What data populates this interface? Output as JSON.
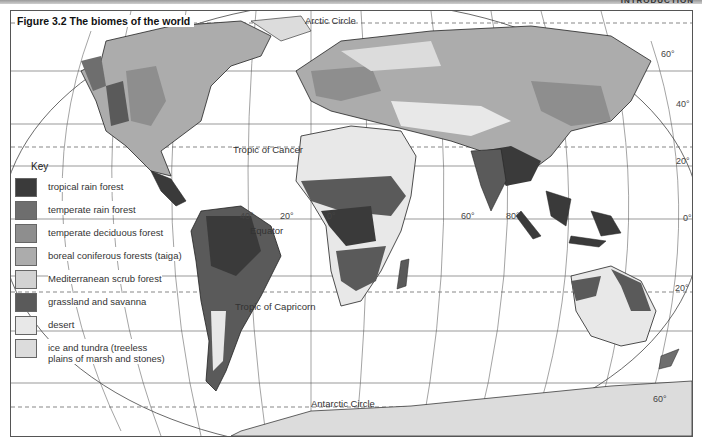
{
  "header": {
    "section": "INTRODUCTION"
  },
  "figure": {
    "title": "Figure 3.2  The biomes of the world"
  },
  "lines": {
    "arctic_circle": "Arctic Circle",
    "tropic_cancer": "Tropic of Cancer",
    "equator": "Equator",
    "tropic_capricorn": "Tropic of Capricorn",
    "antarctic_circle": "Antarctic Circle"
  },
  "latitudes": {
    "n60": "60°",
    "n40": "40°",
    "n20": "20°",
    "eq": "0°",
    "s20": "20°",
    "s60": "60°"
  },
  "longitudes": {
    "w40": "40°",
    "w20": "20°",
    "zero": "0°",
    "e60": "60°",
    "e80": "80°"
  },
  "key": {
    "title": "Key",
    "items": [
      {
        "label": "tropical rain forest",
        "color": "#3a3a3a"
      },
      {
        "label": "temperate rain forest",
        "color": "#6e6e6e"
      },
      {
        "label": "temperate deciduous forest",
        "color": "#8e8e8e"
      },
      {
        "label": "boreal coniferous forests (taiga)",
        "color": "#acacac"
      },
      {
        "label": "Mediterranean scrub forest",
        "color": "#d2d2d2"
      },
      {
        "label": "grassland and savanna",
        "color": "#5a5a5a"
      },
      {
        "label": "desert",
        "color": "#e8e8e8"
      },
      {
        "label": "ice and tundra (treeless plains of marsh and stones)",
        "color": "#dcdcdc"
      }
    ]
  }
}
